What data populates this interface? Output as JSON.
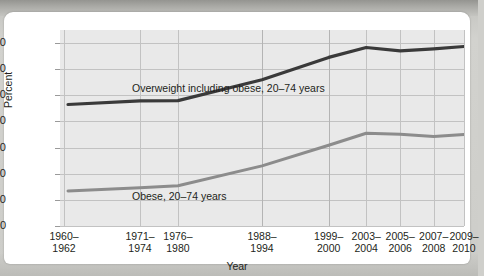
{
  "figure": {
    "ylabel": "Percent",
    "xlabel": "Year",
    "y_ticks": [
      "0",
      "10",
      "20",
      "30",
      "40",
      "50",
      "60",
      "70"
    ],
    "annotations": {
      "overweight_line1": "Overweight including obese,",
      "overweight_line2": "20–74 years",
      "obese": "Obese, 20–74 years"
    },
    "x_ticks": [
      {
        "line1": "1960–",
        "line2": "1962"
      },
      {
        "line1": "1971–",
        "line2": "1974"
      },
      {
        "line1": "1976–",
        "line2": "1980"
      },
      {
        "line1": "1988–",
        "line2": "1994"
      },
      {
        "line1": "1999–",
        "line2": "2000"
      },
      {
        "line1": "2003–",
        "line2": "2004"
      },
      {
        "line1": "2005–",
        "line2": "2006"
      },
      {
        "line1": "2007–",
        "line2": "2008"
      },
      {
        "line1": "2009–",
        "line2": "2010"
      }
    ]
  },
  "chart_data": {
    "type": "line",
    "title": "",
    "xlabel": "Year",
    "ylabel": "Percent",
    "ylim": [
      0,
      75
    ],
    "yticks": [
      0,
      10,
      20,
      30,
      40,
      50,
      60,
      70
    ],
    "grid": true,
    "legend": "inline-annotations",
    "categories": [
      "1960-1962",
      "1971-1974",
      "1976-1980",
      "1988-1994",
      "1999-2000",
      "2003-2004",
      "2005-2006",
      "2007-2008",
      "2009-2010"
    ],
    "x_positions_frac": [
      0.01,
      0.198,
      0.292,
      0.5,
      0.665,
      0.758,
      0.842,
      0.925,
      1.0
    ],
    "series": [
      {
        "name": "Overweight including obese, 20–74 years",
        "color": "#3a3a3a",
        "values": [
          46.5,
          47.9,
          48.0,
          56.0,
          64.5,
          68.3,
          67.0,
          67.8,
          68.7
        ]
      },
      {
        "name": "Obese, 20–74 years",
        "color": "#8c8c8c",
        "values": [
          13.4,
          14.6,
          15.4,
          23.0,
          30.9,
          35.5,
          35.1,
          34.3,
          35.0
        ]
      }
    ]
  },
  "colors": {
    "plot_background": "#e9e9e9",
    "gridline": "#c2c2c2",
    "overweight_series": "#3a3a3a",
    "obese_series": "#8c8c8c",
    "text": "#231f20"
  }
}
